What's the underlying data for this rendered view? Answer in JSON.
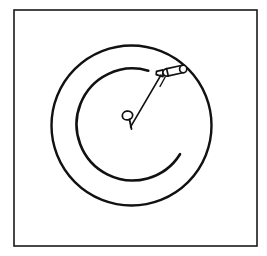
{
  "image": {
    "title": "Coiled Hose With Nozzle Line Drawing",
    "kind": "line-drawing",
    "background_color": "#ffffff",
    "ink_color": "#111111",
    "width": 267,
    "height": 256
  },
  "frame": {
    "name": "picture-frame-border",
    "x": 14,
    "y": 10,
    "width": 243,
    "height": 236,
    "stroke_color": "#1a1a1a",
    "stroke_width": 1.6,
    "fill_color": "#ffffff"
  },
  "shapes": {
    "outer_circle": {
      "label": "outer-coil-ring",
      "cx": 131.5,
      "cy": 125.5,
      "r": 80,
      "stroke_color": "#111111",
      "stroke_width": 2.4
    },
    "inner_arc": {
      "label": "inner-coil-arc",
      "cx": 131,
      "cy": 124,
      "r": 56,
      "start_angle_deg": -72,
      "end_angle_deg": 29,
      "sweep": "counterclockwise-through-left",
      "stroke_color": "#111111",
      "stroke_width": 2.6,
      "path": "M 148.3 70.7 A 56 56 0 1 0 180.0 154.2"
    },
    "center_loop": {
      "label": "center-eyelet-loop",
      "cx": 127.5,
      "cy": 115.5,
      "rx": 5.2,
      "ry": 4.4,
      "rotation_deg": -12,
      "stroke_color": "#111111",
      "stroke_width": 1.8
    },
    "center_tail": {
      "label": "center-loop-tail",
      "x1": 129.5,
      "y1": 119.5,
      "x2": 131.5,
      "y2": 129.0,
      "stroke_color": "#111111",
      "stroke_width": 1.8
    },
    "connector_line": {
      "label": "hose-lead-line",
      "x1": 130.5,
      "y1": 127.0,
      "x2": 161.0,
      "y2": 75.0,
      "stroke_color": "#111111",
      "stroke_width": 1.5
    },
    "nozzle_body": {
      "label": "nozzle-capsule-body",
      "x1": 163.0,
      "y1": 73.2,
      "x2": 184.5,
      "y2": 68.6,
      "thickness": 7.4,
      "stroke_color": "#111111",
      "stroke_width": 1.7,
      "fill_color": "#ffffff"
    },
    "nozzle_collar": {
      "label": "nozzle-collar-divider",
      "x1": 166.6,
      "y1": 68.6,
      "x2": 168.3,
      "y2": 76.0,
      "stroke_color": "#111111",
      "stroke_width": 1.7
    },
    "nozzle_tip": {
      "label": "nozzle-tapered-tip",
      "points": "163.0,69.8 156.5,71.4 156.2,74.6 163.0,76.6",
      "stroke_color": "#111111",
      "stroke_width": 1.7,
      "fill_color": "#111111"
    },
    "nozzle_cap": {
      "label": "nozzle-end-cap",
      "cx": 183.2,
      "cy": 69.0,
      "rx": 3.6,
      "ry": 3.8,
      "stroke_color": "#111111",
      "stroke_width": 1.7,
      "fill_color": "#ffffff"
    },
    "nozzle_trigger": {
      "label": "nozzle-trigger-stem",
      "x1": 165.2,
      "y1": 77.0,
      "x2": 160.0,
      "y2": 86.5,
      "stroke_color": "#111111",
      "stroke_width": 1.4
    }
  }
}
